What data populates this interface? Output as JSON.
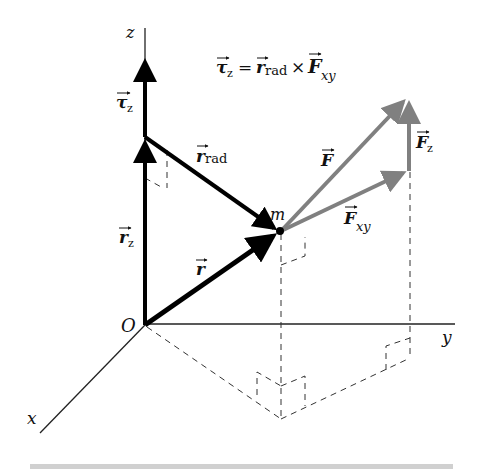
{
  "diagram": {
    "equation": {
      "lhs": "τ",
      "lhs_sub": "z",
      "equals": "=",
      "r": "r",
      "r_sub": "rad",
      "times": "×",
      "F": "F",
      "F_sub": "xy"
    },
    "axes": {
      "z": "z",
      "y": "y",
      "x": "x",
      "origin": "O"
    },
    "points": {
      "mass": "m"
    },
    "vectors": {
      "tau_z": {
        "main": "τ",
        "sub": "z"
      },
      "r_z": {
        "main": "r",
        "sub": "z"
      },
      "r_rad": {
        "main": "r",
        "sub": "rad"
      },
      "r": {
        "main": "r"
      },
      "F": {
        "main": "F"
      },
      "F_z": {
        "main": "F",
        "sub": "z"
      },
      "F_xy": {
        "main": "F",
        "sub": "xy"
      }
    },
    "colors": {
      "black_vectors": "#000000",
      "force_vectors": "#808080",
      "axes": "#222222",
      "dashed": "#333333",
      "bottom_bar": "#d0d0d0"
    }
  }
}
